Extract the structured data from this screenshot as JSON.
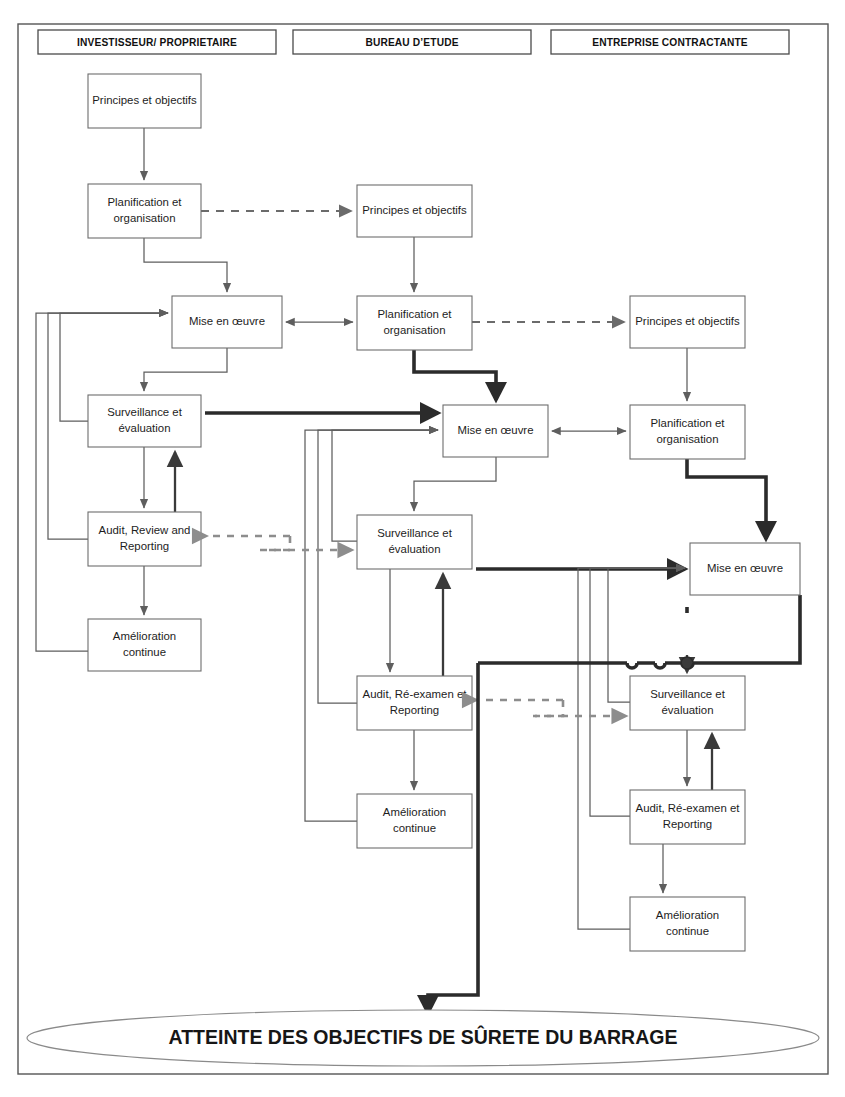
{
  "diagram": {
    "frame": {
      "x": 18,
      "y": 24,
      "w": 810,
      "h": 1050
    },
    "headers": [
      {
        "id": "hdr-investisseur",
        "label": "INVESTISSEUR/ PROPRIETAIRE",
        "x": 38,
        "y": 30,
        "w": 238,
        "h": 24
      },
      {
        "id": "hdr-bureau",
        "label": "BUREAU D’ETUDE",
        "x": 293,
        "y": 30,
        "w": 238,
        "h": 24
      },
      {
        "id": "hdr-entreprise",
        "label": "ENTREPRISE CONTRACTANTE",
        "x": 551,
        "y": 30,
        "w": 238,
        "h": 24
      }
    ],
    "columns": [
      {
        "id": "col-investisseur",
        "owner": "INVESTISSEUR/ PROPRIETAIRE",
        "boxes": [
          {
            "id": "inv-principes",
            "label": "Principes et objectifs",
            "lines": [
              "Principes et objectifs"
            ],
            "x": 88,
            "y": 74,
            "w": 113,
            "h": 54
          },
          {
            "id": "inv-planification",
            "label": "Planification et organisation",
            "lines": [
              "Planification et",
              "organisation"
            ],
            "x": 88,
            "y": 184,
            "w": 113,
            "h": 54
          },
          {
            "id": "inv-mise",
            "label": "Mise en œuvre",
            "lines": [
              "Mise en œuvre"
            ],
            "x": 172,
            "y": 296,
            "w": 110,
            "h": 52
          },
          {
            "id": "inv-surveillance",
            "label": "Surveillance et évaluation",
            "lines": [
              "Surveillance et",
              "évaluation"
            ],
            "x": 88,
            "y": 395,
            "w": 113,
            "h": 52
          },
          {
            "id": "inv-audit",
            "label": "Audit, Review and Reporting",
            "lines": [
              "Audit, Review and",
              "Reporting"
            ],
            "x": 88,
            "y": 512,
            "w": 113,
            "h": 54
          },
          {
            "id": "inv-amelioration",
            "label": "Amélioration continue",
            "lines": [
              "Amélioration",
              "continue"
            ],
            "x": 88,
            "y": 619,
            "w": 113,
            "h": 52
          }
        ]
      },
      {
        "id": "col-bureau",
        "owner": "BUREAU D’ETUDE",
        "boxes": [
          {
            "id": "bur-principes",
            "label": "Principes et objectifs",
            "lines": [
              "Principes et objectifs"
            ],
            "x": 357,
            "y": 185,
            "w": 115,
            "h": 52
          },
          {
            "id": "bur-planification",
            "label": "Planification et organisation",
            "lines": [
              "Planification et",
              "organisation"
            ],
            "x": 357,
            "y": 296,
            "w": 115,
            "h": 54
          },
          {
            "id": "bur-mise",
            "label": "Mise en œuvre",
            "lines": [
              "Mise en œuvre"
            ],
            "x": 443,
            "y": 405,
            "w": 105,
            "h": 52
          },
          {
            "id": "bur-surveillance",
            "label": "Surveillance et évaluation",
            "lines": [
              "Surveillance et",
              "évaluation"
            ],
            "x": 357,
            "y": 515,
            "w": 115,
            "h": 54
          },
          {
            "id": "bur-audit",
            "label": "Audit, Ré-examen et Reporting",
            "lines": [
              "Audit, Ré-examen et",
              "Reporting"
            ],
            "x": 357,
            "y": 676,
            "w": 115,
            "h": 54
          },
          {
            "id": "bur-amelioration",
            "label": "Amélioration continue",
            "lines": [
              "Amélioration",
              "continue"
            ],
            "x": 357,
            "y": 794,
            "w": 115,
            "h": 54
          }
        ]
      },
      {
        "id": "col-entreprise",
        "owner": "ENTREPRISE CONTRACTANTE",
        "boxes": [
          {
            "id": "ent-principes",
            "label": "Principes et objectifs",
            "lines": [
              "Principes et objectifs"
            ],
            "x": 630,
            "y": 296,
            "w": 115,
            "h": 52
          },
          {
            "id": "ent-planification",
            "label": "Planification et organisation",
            "lines": [
              "Planification et",
              "organisation"
            ],
            "x": 630,
            "y": 405,
            "w": 115,
            "h": 54
          },
          {
            "id": "ent-mise",
            "label": "Mise en œuvre",
            "lines": [
              "Mise en œuvre"
            ],
            "x": 690,
            "y": 543,
            "w": 110,
            "h": 52
          },
          {
            "id": "ent-surveillance",
            "label": "Surveillance et évaluation",
            "lines": [
              "Surveillance et",
              "évaluation"
            ],
            "x": 630,
            "y": 676,
            "w": 115,
            "h": 54
          },
          {
            "id": "ent-audit",
            "label": "Audit, Ré-examen et Reporting",
            "lines": [
              "Audit, Ré-examen et",
              "Reporting"
            ],
            "x": 630,
            "y": 790,
            "w": 115,
            "h": 54
          },
          {
            "id": "ent-amelioration",
            "label": "Amélioration continue",
            "lines": [
              "Amélioration",
              "continue"
            ],
            "x": 630,
            "y": 897,
            "w": 115,
            "h": 54
          }
        ]
      }
    ],
    "goal": {
      "id": "goal-ellipse",
      "label": "ATTEINTE DES OBJECTIFS DE SÛRETE DU BARRAGE",
      "cx": 423,
      "cy": 1038,
      "rx": 396,
      "ry": 28
    },
    "legend": {
      "solid_thin": "flux interne du cycle de gestion",
      "dashed": "transmission des exigences",
      "dashed_gray": "retour d’information / reporting",
      "thick": "flux principal de contrôle"
    },
    "colors": {
      "box_stroke": "#6d6d6d",
      "text": "#1d1d1d",
      "thin_line": "#5e5e5e",
      "thick_line": "#2b2b2b",
      "dashed_line": "#6b6b6b",
      "gray_dashed": "#8d8d8d",
      "background": "#ffffff"
    }
  }
}
